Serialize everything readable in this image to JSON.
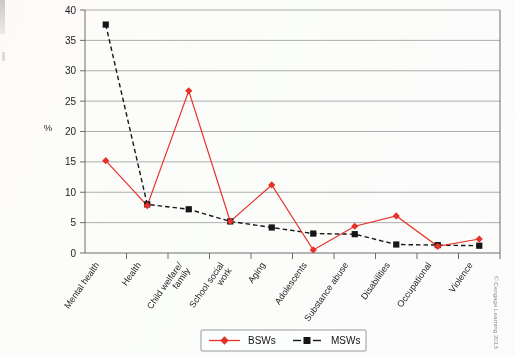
{
  "chart_data": {
    "type": "line",
    "title": "",
    "xlabel": "",
    "ylabel": "%",
    "ylim": [
      0,
      40
    ],
    "ytick_step": 5,
    "yticks": [
      "0",
      "5",
      "10",
      "15",
      "20",
      "25",
      "30",
      "35",
      "40"
    ],
    "grid": true,
    "legend_position": "bottom-center",
    "categories": [
      "Mental health",
      "Health",
      "Child welfare/ family",
      "School social work",
      "Aging",
      "Adolescents",
      "Substance abuse",
      "Disabilities",
      "Occupational",
      "Violence"
    ],
    "series": [
      {
        "name": "BSWs",
        "color": "#e8322a",
        "marker": "diamond",
        "linestyle": "solid",
        "values": [
          15.2,
          7.8,
          26.7,
          5.2,
          11.2,
          0.5,
          4.4,
          6.1,
          1.1,
          2.3
        ]
      },
      {
        "name": "MSWs",
        "color": "#161616",
        "marker": "square",
        "linestyle": "dashed",
        "values": [
          37.6,
          8.0,
          7.2,
          5.2,
          4.2,
          3.2,
          3.1,
          1.4,
          1.3,
          1.2
        ]
      }
    ]
  },
  "legend": {
    "entries": [
      {
        "label": "BSWs"
      },
      {
        "label": "MSWs"
      }
    ]
  },
  "credit": {
    "text": "© Cengage Learning 2013"
  }
}
